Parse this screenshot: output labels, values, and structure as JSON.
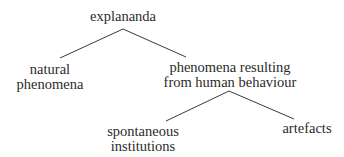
{
  "diagram": {
    "type": "tree",
    "root": {
      "label": "explananda"
    },
    "nodes": {
      "natural": {
        "line1": "natural",
        "line2": "phenomena"
      },
      "human": {
        "line1": "phenomena resulting",
        "line2": "from human behaviour"
      },
      "spontaneous": {
        "line1": "spontaneous",
        "line2": "institutions"
      },
      "artefacts": {
        "label": "artefacts"
      }
    },
    "edges": [
      {
        "from": "explananda",
        "to": "natural phenomena"
      },
      {
        "from": "explananda",
        "to": "phenomena resulting from human behaviour"
      },
      {
        "from": "phenomena resulting from human behaviour",
        "to": "spontaneous institutions"
      },
      {
        "from": "phenomena resulting from human behaviour",
        "to": "artefacts"
      }
    ],
    "colors": {
      "background": "#ffffff",
      "text": "#2b2b2b",
      "line": "#3a3a3a"
    }
  }
}
